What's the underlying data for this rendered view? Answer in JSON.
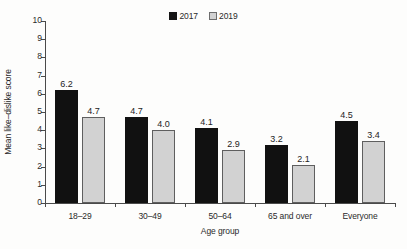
{
  "chart_data": {
    "type": "bar",
    "title": "",
    "xlabel": "Age group",
    "ylabel": "Mean like–dislike score",
    "categories": [
      "18–29",
      "30–49",
      "50–64",
      "65 and over",
      "Everyone"
    ],
    "series": [
      {
        "name": "2017",
        "color": "#111111",
        "values": [
          6.2,
          4.7,
          4.1,
          3.2,
          4.5
        ]
      },
      {
        "name": "2019",
        "color": "#d2d2d2",
        "values": [
          4.7,
          4.0,
          2.9,
          2.1,
          3.4
        ]
      }
    ],
    "value_labels": {
      "2017": [
        "6.2",
        "4.7",
        "4.1",
        "3.2",
        "4.5"
      ],
      "2019": [
        "4.7",
        "4.0",
        "2.9",
        "2.1",
        "3.4"
      ]
    },
    "ylim": [
      0,
      10
    ],
    "yticks": [
      0,
      1,
      2,
      3,
      4,
      5,
      6,
      7,
      8,
      9,
      10
    ],
    "ytick_labels": [
      "0",
      "1",
      "2",
      "3",
      "4",
      "5",
      "6",
      "7",
      "8",
      "9",
      "10"
    ],
    "grid": false,
    "legend_position": "top-center",
    "legend": [
      {
        "label": "2017",
        "swatch": "filled-black-square"
      },
      {
        "label": "2019",
        "swatch": "light-gray-square"
      }
    ]
  }
}
